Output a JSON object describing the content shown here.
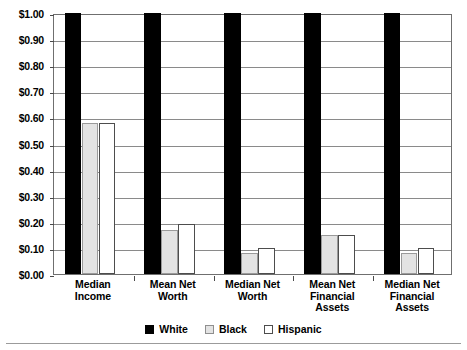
{
  "chart_data": {
    "type": "bar",
    "title": "",
    "subtitle": "",
    "xlabel": "",
    "ylabel": "",
    "ylim": [
      0,
      1.0
    ],
    "ytick_values": [
      0.0,
      0.1,
      0.2,
      0.3,
      0.4,
      0.5,
      0.6,
      0.7,
      0.8,
      0.9,
      1.0
    ],
    "ytick_labels": [
      "$0.00",
      "$0.10",
      "$0.20",
      "$0.30",
      "$0.40",
      "$0.50",
      "$0.60",
      "$0.70",
      "$0.80",
      "$0.90",
      "$1.00"
    ],
    "grid": true,
    "legend_position": "bottom-center",
    "categories": [
      "Median Income",
      "Mean Net Worth",
      "Median Net Worth",
      "Mean Net Financial Assets",
      "Median Net Financial Assets"
    ],
    "category_lines": [
      [
        "Median",
        "Income"
      ],
      [
        "Mean Net",
        "Worth"
      ],
      [
        "Median Net",
        "Worth"
      ],
      [
        "Mean Net",
        "Financial",
        "Assets"
      ],
      [
        "Median Net",
        "Financial",
        "Assets"
      ]
    ],
    "series": [
      {
        "name": "White",
        "color": "#000000",
        "values": [
          1.0,
          1.0,
          1.0,
          1.0,
          1.0
        ]
      },
      {
        "name": "Black",
        "color": "#e3e3e3",
        "values": [
          0.58,
          0.17,
          0.08,
          0.15,
          0.08
        ]
      },
      {
        "name": "Hispanic",
        "color": "#ffffff",
        "values": [
          0.58,
          0.19,
          0.1,
          0.15,
          0.1
        ]
      }
    ]
  },
  "legend": {
    "items": [
      {
        "label": "White",
        "swatch": "black-filled-square"
      },
      {
        "label": "Black",
        "swatch": "light-gray-square"
      },
      {
        "label": "Hispanic",
        "swatch": "white-square"
      }
    ]
  }
}
